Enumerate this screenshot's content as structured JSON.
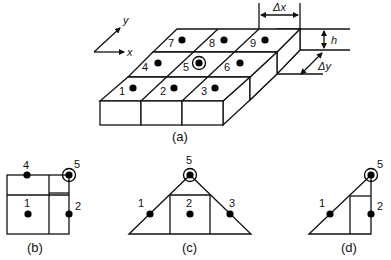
{
  "figure_a": {
    "caption": "(a)",
    "axis_labels": {
      "x": "x",
      "y": "y"
    },
    "dimension_labels": {
      "dx": "Δx",
      "dy": "Δy",
      "h": "h"
    },
    "cells": [
      {
        "id": "1",
        "label": "1"
      },
      {
        "id": "2",
        "label": "2"
      },
      {
        "id": "3",
        "label": "3"
      },
      {
        "id": "4",
        "label": "4"
      },
      {
        "id": "5",
        "label": "5",
        "highlighted": true
      },
      {
        "id": "6",
        "label": "6"
      },
      {
        "id": "7",
        "label": "7"
      },
      {
        "id": "8",
        "label": "8"
      },
      {
        "id": "9",
        "label": "9"
      }
    ]
  },
  "figure_b": {
    "caption": "(b)",
    "nodes": [
      {
        "label": "4"
      },
      {
        "label": "5",
        "highlighted": true
      },
      {
        "label": "1"
      },
      {
        "label": "2"
      }
    ]
  },
  "figure_c": {
    "caption": "(c)",
    "nodes": [
      {
        "label": "5",
        "highlighted": true
      },
      {
        "label": "1"
      },
      {
        "label": "2"
      },
      {
        "label": "3"
      }
    ]
  },
  "figure_d": {
    "caption": "(d)",
    "nodes": [
      {
        "label": "5",
        "highlighted": true
      },
      {
        "label": "1"
      },
      {
        "label": "2"
      }
    ]
  }
}
